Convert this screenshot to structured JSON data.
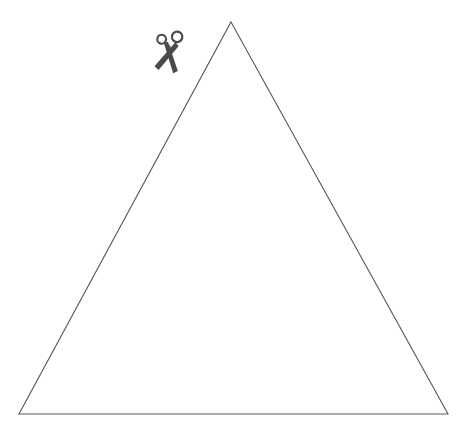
{
  "canvas": {
    "width": 474,
    "height": 435,
    "background_color": "#ffffff",
    "title": "Triangle Cut-Out Template"
  },
  "figure": {
    "type": "cut-out-template",
    "shapes": [
      {
        "name": "triangle",
        "kind": "polygon",
        "stroke_color": "#585858",
        "stroke_width": 1.1,
        "fill": "none",
        "points": [
          {
            "label": "apex",
            "x": 231,
            "y": 22
          },
          {
            "label": "bottom-right",
            "x": 448,
            "y": 414
          },
          {
            "label": "bottom-left",
            "x": 19,
            "y": 414
          }
        ],
        "base_length_px": 429,
        "height_px": 392
      }
    ],
    "icons": [
      {
        "name": "scissors-icon",
        "color": "#4a4a4a",
        "x": 153,
        "y": 29,
        "width": 33,
        "height": 44,
        "rotation_deg": 18,
        "meaning": "cut along the line"
      }
    ]
  },
  "chart_data": {
    "type": "diagram",
    "title": "Triangle Cut-Out Template",
    "xlabel": "",
    "ylabel": "",
    "grid": false,
    "legend": "none",
    "xlim": [
      0,
      474
    ],
    "ylim": [
      0,
      435
    ],
    "annotations": [
      {
        "text": "scissors",
        "x": 169,
        "y": 51
      }
    ],
    "series": [
      {
        "name": "triangle-outline",
        "x": [
          231,
          448,
          19,
          231
        ],
        "y": [
          22,
          414,
          414,
          22
        ]
      }
    ]
  }
}
